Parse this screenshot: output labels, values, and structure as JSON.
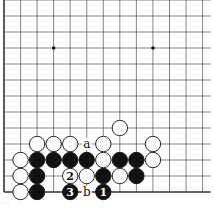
{
  "diagram": {
    "type": "go-board",
    "grid": {
      "cols": 13,
      "rows": 12,
      "x0": 4,
      "dx": 16.55,
      "y_bottom": 192,
      "dy": 16,
      "left_edge": true,
      "bottom_edge": true
    },
    "star_points": [
      {
        "col": 3,
        "row": 9
      },
      {
        "col": 9,
        "row": 9
      }
    ],
    "stones": [
      {
        "col": 1,
        "row": 0,
        "color": "white"
      },
      {
        "col": 2,
        "row": 0,
        "color": "black"
      },
      {
        "col": 4,
        "row": 0,
        "color": "black",
        "label": "3"
      },
      {
        "col": 6,
        "row": 0,
        "color": "black",
        "label": "1"
      },
      {
        "col": 1,
        "row": 1,
        "color": "white"
      },
      {
        "col": 2,
        "row": 1,
        "color": "black"
      },
      {
        "col": 4,
        "row": 1,
        "color": "white",
        "label": "2"
      },
      {
        "col": 5,
        "row": 1,
        "color": "white"
      },
      {
        "col": 6,
        "row": 1,
        "color": "black"
      },
      {
        "col": 7,
        "row": 1,
        "color": "white"
      },
      {
        "col": 8,
        "row": 1,
        "color": "black"
      },
      {
        "col": 1,
        "row": 2,
        "color": "white"
      },
      {
        "col": 2,
        "row": 2,
        "color": "black"
      },
      {
        "col": 3,
        "row": 2,
        "color": "black"
      },
      {
        "col": 4,
        "row": 2,
        "color": "black"
      },
      {
        "col": 5,
        "row": 2,
        "color": "black"
      },
      {
        "col": 6,
        "row": 2,
        "color": "white"
      },
      {
        "col": 7,
        "row": 2,
        "color": "black"
      },
      {
        "col": 8,
        "row": 2,
        "color": "black"
      },
      {
        "col": 9,
        "row": 2,
        "color": "white"
      },
      {
        "col": 2,
        "row": 3,
        "color": "white"
      },
      {
        "col": 3,
        "row": 3,
        "color": "white"
      },
      {
        "col": 4,
        "row": 3,
        "color": "white"
      },
      {
        "col": 6,
        "row": 3,
        "color": "white"
      },
      {
        "col": 9,
        "row": 3,
        "color": "white"
      },
      {
        "col": 7,
        "row": 4,
        "color": "white"
      }
    ],
    "point_labels": [
      {
        "col": 5,
        "row": 3,
        "text": "a"
      },
      {
        "col": 5,
        "row": 0,
        "text": "b"
      }
    ],
    "caption": "· ··"
  }
}
